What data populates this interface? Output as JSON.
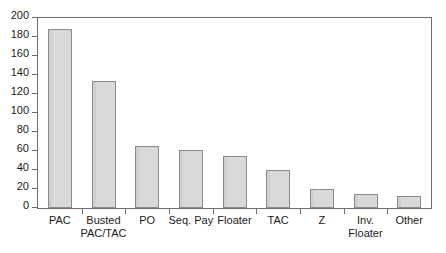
{
  "chart_data": {
    "type": "bar",
    "title": "",
    "subtitle": "",
    "xlabel": "",
    "ylabel": "",
    "categories": [
      "PAC",
      "Busted\nPAC/TAC",
      "PO",
      "Seq. Pay",
      "Floater",
      "TAC",
      "Z",
      "Inv.\nFloater",
      "Other"
    ],
    "values": [
      188,
      134,
      65,
      61,
      55,
      40,
      20,
      15,
      13
    ],
    "ylim": [
      0,
      200
    ],
    "yticks": [
      0,
      20,
      40,
      60,
      80,
      100,
      120,
      140,
      160,
      180,
      200
    ],
    "ytick_labels": [
      "0",
      "20",
      "40",
      "60",
      "80",
      "100",
      "120",
      "140",
      "160",
      "180",
      "200"
    ],
    "grid": false,
    "legend": null,
    "legend_position": "none",
    "bar_fill_color": "#d9d9d9",
    "bar_edge_color": "#8a8a8a",
    "axis_color": "#6e6e6e",
    "text_color": "#1a1a1a",
    "background_color": "#ffffff"
  }
}
